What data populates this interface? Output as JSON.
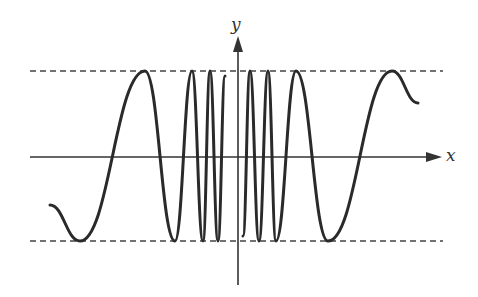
{
  "chart_data": {
    "type": "line",
    "title": "",
    "xlabel": "x",
    "ylabel": "y",
    "bounds": {
      "upper": 1,
      "lower": -1,
      "style": "dashed"
    },
    "series": [
      {
        "name": "y = sin(1/x)",
        "function": "sin(1/x)"
      }
    ],
    "extrema_pixels": {
      "maxima_x": [
        145,
        192,
        210,
        250,
        268,
        296,
        392
      ],
      "minima_x": [
        80,
        175,
        203,
        218,
        259,
        276,
        328
      ]
    },
    "grid": false,
    "legend": false
  },
  "axes": {
    "x_label": "x",
    "y_label": "y"
  },
  "colors": {
    "curve": "#2a2a2a",
    "axis": "#333333",
    "dash": "#444444"
  }
}
